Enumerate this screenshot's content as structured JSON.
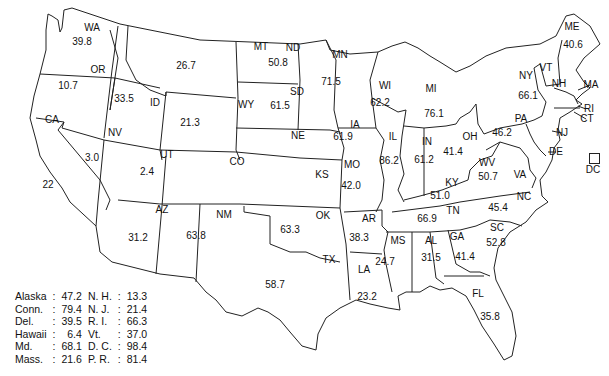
{
  "map": {
    "region": "United States",
    "states": [
      {
        "abbr": "WA",
        "value": "39.8",
        "lx": 92,
        "ly": 28,
        "vx": 82,
        "vy": 42
      },
      {
        "abbr": "OR",
        "value": "10.7",
        "lx": 98,
        "ly": 70,
        "vx": 68,
        "vy": 86
      },
      {
        "abbr": "CA",
        "value": "22",
        "lx": 52,
        "ly": 120,
        "vx": 48,
        "vy": 185
      },
      {
        "abbr": "ID",
        "value": "33.5",
        "lx": 155,
        "ly": 103,
        "vx": 124,
        "vy": 99
      },
      {
        "abbr": "NV",
        "value": "3.0",
        "lx": 115,
        "ly": 133,
        "vx": 92,
        "vy": 158
      },
      {
        "abbr": "MT",
        "value": "26.7",
        "lx": 261,
        "ly": 47,
        "vx": 186,
        "vy": 66
      },
      {
        "abbr": "WY",
        "value": "21.3",
        "lx": 246,
        "ly": 105,
        "vx": 190,
        "vy": 123
      },
      {
        "abbr": "UT",
        "value": "2.4",
        "lx": 167,
        "ly": 155,
        "vx": 147,
        "vy": 172
      },
      {
        "abbr": "AZ",
        "value": "31.2",
        "lx": 162,
        "ly": 210,
        "vx": 138,
        "vy": 238
      },
      {
        "abbr": "CO",
        "value": "",
        "lx": 237,
        "ly": 162,
        "vx": 0,
        "vy": 0
      },
      {
        "abbr": "NM",
        "value": "63.8",
        "lx": 224,
        "ly": 215,
        "vx": 196,
        "vy": 236
      },
      {
        "abbr": "ND",
        "value": "50.8",
        "lx": 293,
        "ly": 48,
        "vx": 278,
        "vy": 63
      },
      {
        "abbr": "SD",
        "value": "61.5",
        "lx": 297,
        "ly": 92,
        "vx": 280,
        "vy": 106
      },
      {
        "abbr": "NE",
        "value": "",
        "lx": 298,
        "ly": 136,
        "vx": 0,
        "vy": 0
      },
      {
        "abbr": "KS",
        "value": "",
        "lx": 322,
        "ly": 175,
        "vx": 0,
        "vy": 0
      },
      {
        "abbr": "OK",
        "value": "63.3",
        "lx": 323,
        "ly": 216,
        "vx": 290,
        "vy": 230
      },
      {
        "abbr": "TX",
        "value": "58.7",
        "lx": 329,
        "ly": 260,
        "vx": 275,
        "vy": 285
      },
      {
        "abbr": "MN",
        "value": "71.5",
        "lx": 340,
        "ly": 55,
        "vx": 331,
        "vy": 82
      },
      {
        "abbr": "IA",
        "value": "61.9",
        "lx": 355,
        "ly": 125,
        "vx": 343,
        "vy": 137
      },
      {
        "abbr": "MO",
        "value": "42.0",
        "lx": 352,
        "ly": 165,
        "vx": 351,
        "vy": 186
      },
      {
        "abbr": "AR",
        "value": "38.3",
        "lx": 369,
        "ly": 219,
        "vx": 359,
        "vy": 238
      },
      {
        "abbr": "LA",
        "value": "23.2",
        "lx": 364,
        "ly": 270,
        "vx": 367,
        "vy": 297
      },
      {
        "abbr": "WI",
        "value": "62.2",
        "lx": 385,
        "ly": 86,
        "vx": 380,
        "vy": 103
      },
      {
        "abbr": "IL",
        "value": "86.2",
        "lx": 393,
        "ly": 137,
        "vx": 389,
        "vy": 161
      },
      {
        "abbr": "MS",
        "value": "24.7",
        "lx": 398,
        "ly": 241,
        "vx": 385,
        "vy": 262
      },
      {
        "abbr": "MI",
        "value": "76.1",
        "lx": 431,
        "ly": 89,
        "vx": 434,
        "vy": 114
      },
      {
        "abbr": "IN",
        "value": "61.2",
        "lx": 427,
        "ly": 142,
        "vx": 424,
        "vy": 160
      },
      {
        "abbr": "AL",
        "value": "31.5",
        "lx": 431,
        "ly": 241,
        "vx": 431,
        "vy": 258
      },
      {
        "abbr": "OH",
        "value": "41.4",
        "lx": 470,
        "ly": 137,
        "vx": 453,
        "vy": 152
      },
      {
        "abbr": "KY",
        "value": "51.0",
        "lx": 452,
        "ly": 183,
        "vx": 440,
        "vy": 196
      },
      {
        "abbr": "TN",
        "value": "66.9",
        "lx": 453,
        "ly": 211,
        "vx": 427,
        "vy": 219
      },
      {
        "abbr": "GA",
        "value": "41.4",
        "lx": 457,
        "ly": 237,
        "vx": 465,
        "vy": 257
      },
      {
        "abbr": "FL",
        "value": "35.8",
        "lx": 478,
        "ly": 294,
        "vx": 490,
        "vy": 317
      },
      {
        "abbr": "WV",
        "value": "50.7",
        "lx": 487,
        "ly": 163,
        "vx": 488,
        "vy": 177
      },
      {
        "abbr": "SC",
        "value": "52.8",
        "lx": 497,
        "ly": 228,
        "vx": 496,
        "vy": 243
      },
      {
        "abbr": "NC",
        "value": "45.4",
        "lx": 524,
        "ly": 197,
        "vx": 498,
        "vy": 208
      },
      {
        "abbr": "VA",
        "value": "",
        "lx": 520,
        "ly": 175,
        "vx": 0,
        "vy": 0
      },
      {
        "abbr": "PA",
        "value": "46.2",
        "lx": 521,
        "ly": 119,
        "vx": 502,
        "vy": 133
      },
      {
        "abbr": "NY",
        "value": "66.1",
        "lx": 526,
        "ly": 76,
        "vx": 528,
        "vy": 96
      },
      {
        "abbr": "VT",
        "value": "",
        "lx": 546,
        "ly": 68,
        "vx": 0,
        "vy": 0
      },
      {
        "abbr": "NH",
        "value": "",
        "lx": 559,
        "ly": 84,
        "vx": 0,
        "vy": 0
      },
      {
        "abbr": "ME",
        "value": "40.6",
        "lx": 572,
        "ly": 27,
        "vx": 573,
        "vy": 45
      },
      {
        "abbr": "MA",
        "value": "",
        "lx": 591,
        "ly": 85,
        "vx": 0,
        "vy": 0
      },
      {
        "abbr": "RI",
        "value": "",
        "lx": 589,
        "ly": 109,
        "vx": 0,
        "vy": 0
      },
      {
        "abbr": "CT",
        "value": "",
        "lx": 587,
        "ly": 119,
        "vx": 0,
        "vy": 0
      },
      {
        "abbr": "NJ",
        "value": "",
        "lx": 562,
        "ly": 133,
        "vx": 0,
        "vy": 0
      },
      {
        "abbr": "DE",
        "value": "",
        "lx": 556,
        "ly": 152,
        "vx": 0,
        "vy": 0
      },
      {
        "abbr": "DC",
        "value": "",
        "lx": 593,
        "ly": 170,
        "vx": 0,
        "vy": 0
      }
    ]
  },
  "legend": {
    "rows": [
      {
        "l_name": "Alaska",
        "l_val": "47.2",
        "r_name": "N. H.",
        "r_val": "13.3"
      },
      {
        "l_name": "Conn.",
        "l_val": "79.4",
        "r_name": "N. J.",
        "r_val": "21.4"
      },
      {
        "l_name": "Del.",
        "l_val": "39.5",
        "r_name": "R. I.",
        "r_val": "66.3"
      },
      {
        "l_name": "Hawaii",
        "l_val": "6.4",
        "r_name": "Vt.",
        "r_val": "37.0"
      },
      {
        "l_name": "Md.",
        "l_val": "68.1",
        "r_name": "D. C.",
        "r_val": "98.4"
      },
      {
        "l_name": "Mass.",
        "l_val": "21.6",
        "r_name": "P. R.",
        "r_val": "81.4"
      }
    ],
    "separator": ":"
  }
}
